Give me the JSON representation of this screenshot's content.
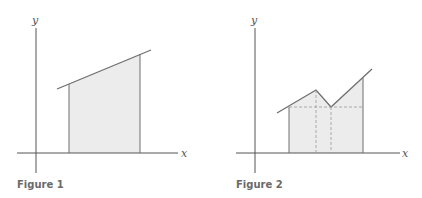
{
  "colors": {
    "axis": "#555555",
    "curve": "#6f6f6f",
    "fill": "#ececec",
    "dashed": "#9a9a9a",
    "caption": "#6a6a6a"
  },
  "figures": [
    {
      "caption": "Figure 1",
      "x_label": "x",
      "y_label": "y",
      "description": "Area under a straight line between two vertical boundaries, shaded as a trapezoid"
    },
    {
      "caption": "Figure 2",
      "x_label": "x",
      "y_label": "y",
      "description": "Area under a piecewise linear curve with a peak and a dip, split by dashed lines into rectangles and triangles"
    }
  ]
}
